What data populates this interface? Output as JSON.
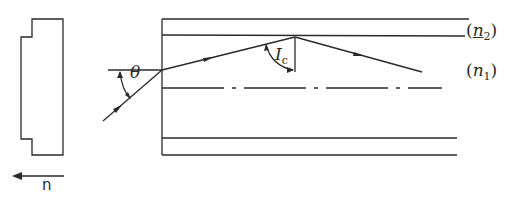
{
  "diagram": {
    "type": "optical-fiber-ray-diagram",
    "labels": {
      "theta": "θ",
      "critical_angle": "I",
      "critical_angle_sub": "c",
      "cladding_index": "n",
      "cladding_index_sub": "2",
      "core_index": "n",
      "core_index_sub": "1",
      "direction_label": "n"
    },
    "regions": [
      {
        "name": "cladding",
        "index_label": "(n2)"
      },
      {
        "name": "core",
        "index_label": "(n1)"
      }
    ],
    "colors": {
      "line": "#2a2a2a",
      "background": "#ffffff"
    }
  }
}
